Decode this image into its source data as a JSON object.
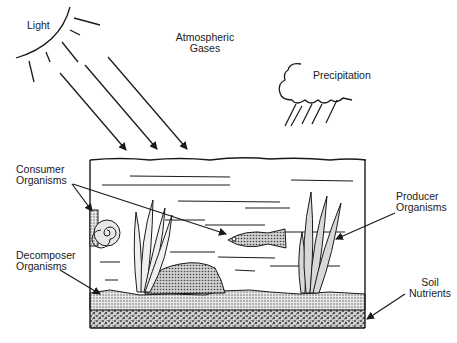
{
  "diagram": {
    "type": "ecosystem-aquarium",
    "labels": {
      "light": "Light",
      "atmospheric_gases_line1": "Atmospheric",
      "atmospheric_gases_line2": "Gases",
      "precipitation": "Precipitation",
      "consumer_line1": "Consumer",
      "consumer_line2": "Organisms",
      "decomposer_line1": "Decomposer",
      "decomposer_line2": "Organisms",
      "producer_line1": "Producer",
      "producer_line2": "Organisms",
      "soil_line1": "Soil",
      "soil_line2": "Nutrients"
    },
    "colors": {
      "ink": "#1a1a1a",
      "soil": "#b8b8b8",
      "rock": "#a8a8a8",
      "background": "#ffffff"
    }
  }
}
